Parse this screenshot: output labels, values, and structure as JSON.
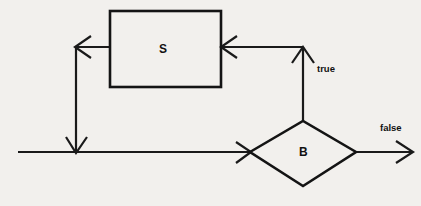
{
  "diagram": {
    "background_color": "#f2f0ed",
    "line_color": "#1a1a1a",
    "nodes": [
      {
        "id": "statement",
        "shape": "rectangle",
        "label": "S",
        "x": 110,
        "y": 11,
        "width": 111,
        "height": 76
      },
      {
        "id": "condition",
        "shape": "diamond",
        "label": "B",
        "cx": 303,
        "cy": 152,
        "half_width": 53,
        "half_height": 31
      }
    ],
    "edges": [
      {
        "id": "entry",
        "from": "start",
        "to": "condition",
        "label": "",
        "path": "M 18 152 L 250 152"
      },
      {
        "id": "true-branch",
        "from": "condition",
        "to": "statement",
        "label": "true",
        "path": "M 303 122 L 303 48 L 221 48"
      },
      {
        "id": "loop-back",
        "from": "statement",
        "to": "entry",
        "label": "",
        "path": "M 110 47 L 76 47 L 76 152"
      },
      {
        "id": "false-branch",
        "from": "condition",
        "to": "exit",
        "label": "false",
        "path": "M 355 152 L 413 152"
      }
    ],
    "labels": {
      "statement_label": "S",
      "condition_label": "B",
      "true_label": "true",
      "false_label": "false"
    }
  }
}
